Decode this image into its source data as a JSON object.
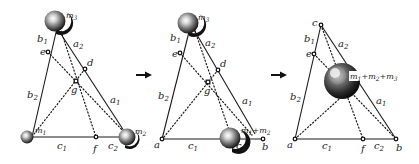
{
  "figure": {
    "arrows": [
      {
        "from_panel": 1,
        "to_panel": 2
      },
      {
        "from_panel": 2,
        "to_panel": 3
      }
    ],
    "panels": [
      {
        "id": 1,
        "masses": [
          {
            "label": "m",
            "sub": "3",
            "position": "top vertex"
          },
          {
            "label": "m",
            "sub": "1",
            "position": "bottom-left vertex"
          },
          {
            "label": "m",
            "sub": "2",
            "position": "bottom-right vertex"
          }
        ],
        "points": [
          "e",
          "d",
          "g",
          "f"
        ],
        "segments": [
          {
            "label": "b",
            "sub": "1"
          },
          {
            "label": "b",
            "sub": "2"
          },
          {
            "label": "a",
            "sub": "2"
          },
          {
            "label": "a",
            "sub": "1"
          },
          {
            "label": "c",
            "sub": "1"
          },
          {
            "label": "c",
            "sub": "2"
          }
        ]
      },
      {
        "id": 2,
        "masses": [
          {
            "label": "m",
            "sub": "3",
            "position": "top vertex"
          },
          {
            "label": "m₁+m₂",
            "position": "point f on base"
          }
        ],
        "points": [
          "e",
          "d",
          "g",
          "a",
          "b"
        ],
        "segments": [
          {
            "label": "b",
            "sub": "1"
          },
          {
            "label": "b",
            "sub": "2"
          },
          {
            "label": "a",
            "sub": "2"
          },
          {
            "label": "a",
            "sub": "1"
          },
          {
            "label": "c",
            "sub": "1"
          },
          {
            "label": "c",
            "sub": "2"
          }
        ]
      },
      {
        "id": 3,
        "masses": [
          {
            "label": "m₁+m₂+m₃",
            "position": "point g (centroid)"
          }
        ],
        "points": [
          "c",
          "e",
          "a",
          "f",
          "b"
        ],
        "segments": [
          {
            "label": "b",
            "sub": "1"
          },
          {
            "label": "b",
            "sub": "2"
          },
          {
            "label": "a",
            "sub": "2"
          },
          {
            "label": "a",
            "sub": "1"
          },
          {
            "label": "c",
            "sub": "1"
          },
          {
            "label": "c",
            "sub": "2"
          }
        ]
      }
    ]
  },
  "labels": {
    "p1": {
      "m3": "m",
      "m3s": "3",
      "m1": "m",
      "m1s": "1",
      "m2": "m",
      "m2s": "2",
      "b1": "b",
      "b1s": "1",
      "b2": "b",
      "b2s": "2",
      "a2": "a",
      "a2s": "2",
      "a1": "a",
      "a1s": "1",
      "c1": "c",
      "c1s": "1",
      "c2": "c",
      "c2s": "2",
      "e": "e",
      "d": "d",
      "g": "g",
      "f": "f"
    },
    "p2": {
      "m3": "m",
      "m3s": "3",
      "m12": "m",
      "m12s1": "1",
      "m12plus": "+m",
      "m12s2": "2",
      "b1": "b",
      "b1s": "1",
      "b2": "b",
      "b2s": "2",
      "a2": "a",
      "a2s": "2",
      "a1": "a",
      "a1s": "1",
      "c1": "c",
      "c1s": "1",
      "c2": "c",
      "c2s": "2",
      "e": "e",
      "d": "d",
      "g": "g",
      "a": "a",
      "b": "b"
    },
    "p3": {
      "m123a": "m",
      "m123s1": "1",
      "m123b": "+m",
      "m123s2": "2",
      "m123c": "+m",
      "m123s3": "3",
      "b1": "b",
      "b1s": "1",
      "b2": "b",
      "b2s": "2",
      "a2": "a",
      "a2s": "2",
      "a1": "a",
      "a1s": "1",
      "c1": "c",
      "c1s": "1",
      "c2": "c",
      "c2s": "2",
      "c": "c",
      "e": "e",
      "a": "a",
      "f": "f",
      "b": "b"
    }
  },
  "colors": {
    "ink": "#1a1a1a",
    "ball_dark": "#111111",
    "ball_mid": "#6b6b6b",
    "ball_light": "#e8e8e8"
  }
}
